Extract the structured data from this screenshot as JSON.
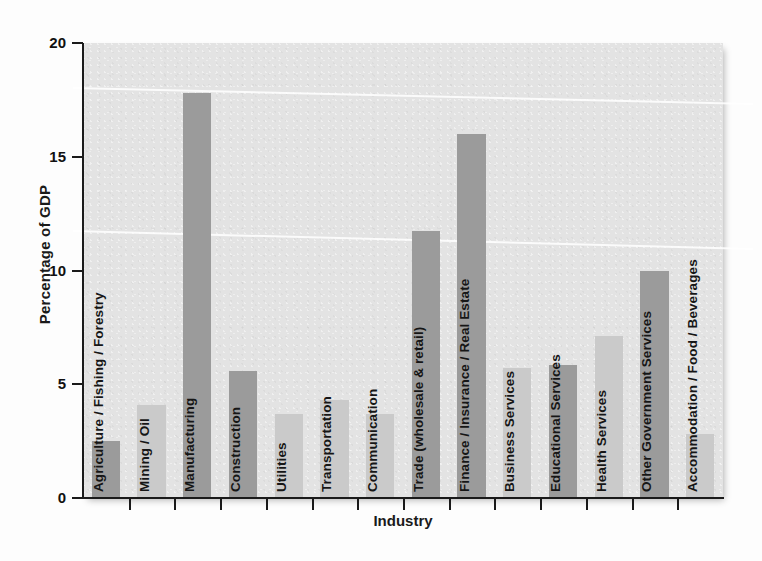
{
  "chart_data": {
    "type": "bar",
    "title": "",
    "xlabel": "Industry",
    "ylabel": "Percentage of GDP",
    "ylim": [
      0,
      20
    ],
    "yticks": [
      0,
      5,
      10,
      15,
      20
    ],
    "ytick_labels": [
      "0",
      "5",
      "10",
      "15",
      "20"
    ],
    "grid": false,
    "legend": "none",
    "categories": [
      "Agriculture / Fishing / Forestry",
      "Mining / Oil",
      "Manufacturing",
      "Construction",
      "Utilities",
      "Transportation",
      "Communication",
      "Trade (wholesale & retail)",
      "Finance / Insurance / Real Estate",
      "Business Services",
      "Educational Services",
      "Health Services",
      "Other Government Services",
      "Accommodation / Food / Beverages"
    ],
    "values": [
      2.5,
      4.1,
      17.8,
      5.6,
      3.7,
      4.3,
      3.7,
      11.75,
      16.0,
      5.7,
      5.85,
      7.1,
      10.0,
      2.8
    ],
    "bar_shades": [
      "dark",
      "light",
      "dark",
      "dark",
      "light",
      "light",
      "light",
      "dark",
      "dark",
      "light",
      "dark",
      "light",
      "dark",
      "light"
    ]
  },
  "colors": {
    "plot_background": "#e3e3e3",
    "bar_dark": "#9b9b9b",
    "bar_light": "#cacaca",
    "axis": "#1a1a1a",
    "text": "#111111",
    "page_background": "#ffffff"
  }
}
